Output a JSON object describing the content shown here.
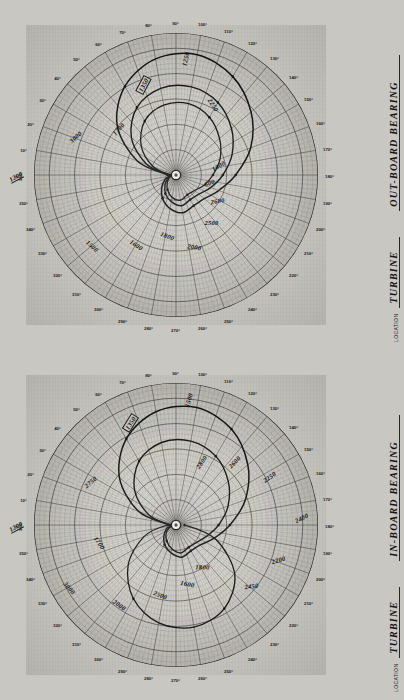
{
  "document": {
    "title": "Turbine Bearing Polar Vibration Charts",
    "sheet_color": "#c9c7c1",
    "ink_color": "#1a1a1a",
    "page_color": "#cfcdc8"
  },
  "labels": {
    "location_caption": "LOCATION",
    "degree_suffix": "°"
  },
  "charts": [
    {
      "id": "out-board-bearing",
      "location": "TURBINE",
      "bearing": "OUT-BOARD BEARING",
      "zero_label_top": "0°",
      "zero_label_bottom": "360°",
      "degree_ticks": [
        "10°",
        "20°",
        "30°",
        "40°",
        "50°",
        "60°",
        "70°",
        "80°",
        "90°",
        "100°",
        "110°",
        "120°",
        "130°",
        "140°",
        "150°",
        "160°",
        "170°",
        "180°",
        "190°",
        "200°",
        "210°",
        "220°",
        "230°",
        "240°",
        "250°",
        "260°",
        "270°",
        "280°",
        "290°",
        "300°",
        "310°",
        "320°",
        "330°",
        "340°",
        "350°"
      ],
      "annotations": [
        {
          "text": "1200",
          "boxed": false,
          "underline": true
        },
        {
          "text": "3000",
          "boxed": false,
          "underline": false
        },
        {
          "text": "1700",
          "boxed": false,
          "underline": false
        },
        {
          "text": "1350",
          "boxed": true,
          "underline": false
        },
        {
          "text": "1250",
          "boxed": false,
          "underline": false
        },
        {
          "text": "2250",
          "boxed": false,
          "underline": false
        },
        {
          "text": "1500",
          "boxed": false,
          "underline": false
        },
        {
          "text": "1600",
          "boxed": false,
          "underline": false
        },
        {
          "text": "1800",
          "boxed": false,
          "underline": false
        },
        {
          "text": "2000",
          "boxed": false,
          "underline": false
        },
        {
          "text": "2500",
          "boxed": false,
          "underline": false
        },
        {
          "text": "2600",
          "boxed": false,
          "underline": false
        },
        {
          "text": "600",
          "boxed": false,
          "underline": false
        },
        {
          "text": "1000",
          "boxed": false,
          "underline": false
        }
      ]
    },
    {
      "id": "in-board-bearing",
      "location": "TURBINE",
      "bearing": "IN-BOARD BEARING",
      "zero_label_top": "0°",
      "zero_label_bottom": "360°",
      "degree_ticks": [
        "10°",
        "20°",
        "30°",
        "40°",
        "50°",
        "60°",
        "70°",
        "80°",
        "90°",
        "100°",
        "110°",
        "120°",
        "130°",
        "140°",
        "150°",
        "160°",
        "170°",
        "180°",
        "190°",
        "200°",
        "210°",
        "220°",
        "230°",
        "240°",
        "250°",
        "260°",
        "270°",
        "280°",
        "290°",
        "300°",
        "310°",
        "320°",
        "330°",
        "340°",
        "350°"
      ],
      "annotations": [
        {
          "text": "1200",
          "boxed": false,
          "underline": true
        },
        {
          "text": "1350",
          "boxed": true,
          "underline": false
        },
        {
          "text": "1500",
          "boxed": false,
          "underline": false
        },
        {
          "text": "2750",
          "boxed": false,
          "underline": false
        },
        {
          "text": "2000",
          "boxed": false,
          "underline": false
        },
        {
          "text": "3000",
          "boxed": false,
          "underline": false
        },
        {
          "text": "1700",
          "boxed": false,
          "underline": false
        },
        {
          "text": "2500",
          "boxed": false,
          "underline": false
        },
        {
          "text": "1600",
          "boxed": false,
          "underline": false
        },
        {
          "text": "1800",
          "boxed": false,
          "underline": false
        },
        {
          "text": "2200",
          "boxed": false,
          "underline": false
        },
        {
          "text": "2400",
          "boxed": false,
          "underline": false
        },
        {
          "text": "2250",
          "boxed": false,
          "underline": false
        },
        {
          "text": "2450",
          "boxed": false,
          "underline": false
        },
        {
          "text": "2600",
          "boxed": false,
          "underline": false
        },
        {
          "text": "2800",
          "boxed": false,
          "underline": false
        }
      ]
    }
  ],
  "chart_data": [
    {
      "type": "line",
      "title": "OUT-BOARD BEARING",
      "subtitle": "LOCATION TURBINE",
      "coordinate_system": "polar",
      "xlabel": "Phase angle (degrees)",
      "ylabel": "Vibration amplitude (radial units)",
      "theta_unit": "degrees",
      "theta_range": [
        0,
        360
      ],
      "r_range": [
        0,
        10
      ],
      "grid": true,
      "legend": "none",
      "tick_labels": [
        "0°",
        "10°",
        "20°",
        "30°",
        "40°",
        "50°",
        "60°",
        "70°",
        "80°",
        "90°",
        "100°",
        "110°",
        "120°",
        "130°",
        "140°",
        "150°",
        "160°",
        "170°",
        "180°",
        "190°",
        "200°",
        "210°",
        "220°",
        "230°",
        "240°",
        "250°",
        "260°",
        "270°",
        "280°",
        "290°",
        "300°",
        "310°",
        "320°",
        "330°",
        "340°",
        "350°",
        "360°"
      ],
      "series": [
        {
          "name": "outer loop (high speed)",
          "rpm_labels": [
            "1200",
            "3000",
            "1500",
            "2000",
            "2600"
          ],
          "theta": [
            0,
            20,
            40,
            60,
            80,
            100,
            120,
            140,
            160,
            180,
            200,
            220,
            240,
            260,
            280,
            300,
            320,
            340
          ],
          "r": [
            0.6,
            2.9,
            5.4,
            7.2,
            8.3,
            8.6,
            8.0,
            6.9,
            5.6,
            4.2,
            3.2,
            2.6,
            2.5,
            2.7,
            2.4,
            1.9,
            1.3,
            0.8
          ]
        },
        {
          "name": "middle loop",
          "rpm_labels": [
            "1700",
            "2250",
            "1800",
            "2500"
          ],
          "theta": [
            0,
            20,
            40,
            60,
            80,
            100,
            120,
            140,
            160,
            180,
            200,
            220,
            240,
            260,
            280,
            300,
            320,
            340
          ],
          "r": [
            0.5,
            2.2,
            4.1,
            5.5,
            6.2,
            6.3,
            5.9,
            5.1,
            4.2,
            3.3,
            2.6,
            2.1,
            2.0,
            2.2,
            1.9,
            1.5,
            1.0,
            0.6
          ]
        },
        {
          "name": "inner loop (low speed)",
          "rpm_labels": [
            "1250",
            "1350",
            "1600",
            "1000",
            "600"
          ],
          "theta": [
            0,
            20,
            40,
            60,
            80,
            100,
            120,
            140,
            160,
            180,
            200,
            220,
            240,
            260,
            280,
            300,
            320,
            340
          ],
          "r": [
            0.4,
            1.7,
            3.2,
            4.4,
            5.0,
            5.1,
            4.7,
            4.0,
            3.3,
            2.6,
            2.1,
            1.7,
            1.6,
            1.8,
            1.6,
            1.2,
            0.8,
            0.5
          ]
        }
      ]
    },
    {
      "type": "line",
      "title": "IN-BOARD BEARING",
      "subtitle": "LOCATION TURBINE",
      "coordinate_system": "polar",
      "xlabel": "Phase angle (degrees)",
      "ylabel": "Vibration amplitude (radial units)",
      "theta_unit": "degrees",
      "theta_range": [
        0,
        360
      ],
      "r_range": [
        0,
        10
      ],
      "grid": true,
      "legend": "none",
      "tick_labels": [
        "0°",
        "10°",
        "20°",
        "30°",
        "40°",
        "50°",
        "60°",
        "70°",
        "80°",
        "90°",
        "100°",
        "110°",
        "120°",
        "130°",
        "140°",
        "150°",
        "160°",
        "170°",
        "180°",
        "190°",
        "200°",
        "210°",
        "220°",
        "230°",
        "240°",
        "250°",
        "260°",
        "270°",
        "280°",
        "290°",
        "300°",
        "310°",
        "320°",
        "330°",
        "340°",
        "350°",
        "360°"
      ],
      "series": [
        {
          "name": "upper outer loop",
          "rpm_labels": [
            "1200",
            "1350",
            "1500",
            "3000"
          ],
          "theta": [
            0,
            20,
            40,
            60,
            80,
            100,
            120,
            140,
            160,
            180,
            200,
            220,
            240,
            260,
            280,
            300,
            320,
            340
          ],
          "r": [
            0.5,
            2.8,
            5.2,
            7.0,
            8.1,
            8.4,
            7.8,
            6.6,
            5.2,
            3.8,
            2.8,
            2.2,
            2.1,
            2.3,
            2.0,
            1.6,
            1.1,
            0.7
          ]
        },
        {
          "name": "upper inner loop",
          "rpm_labels": [
            "2000",
            "2750",
            "1700",
            "2500"
          ],
          "theta": [
            0,
            20,
            40,
            60,
            80,
            100,
            120,
            140,
            160,
            180,
            200,
            220,
            240,
            260,
            280,
            300,
            320,
            340
          ],
          "r": [
            0.4,
            2.0,
            3.8,
            5.2,
            5.9,
            6.0,
            5.6,
            4.8,
            3.9,
            3.0,
            2.3,
            1.9,
            1.8,
            2.0,
            1.7,
            1.3,
            0.9,
            0.5
          ]
        },
        {
          "name": "lower loop",
          "rpm_labels": [
            "2200",
            "2400",
            "2450",
            "2600",
            "2800",
            "2250"
          ],
          "theta": [
            180,
            200,
            220,
            240,
            260,
            280,
            300,
            320,
            340,
            0
          ],
          "r": [
            0.6,
            3.0,
            5.4,
            6.8,
            7.3,
            7.0,
            6.0,
            4.4,
            2.4,
            0.6
          ]
        }
      ]
    }
  ]
}
